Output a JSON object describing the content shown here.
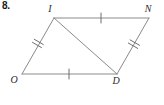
{
  "problem": {
    "number_label": "8."
  },
  "figure": {
    "type": "parallelogram-with-diagonal",
    "stroke_color": "#8a8a8a",
    "label_color": "#2b2b2b",
    "vertices": [
      {
        "name": "I",
        "label": "I",
        "x": 54,
        "y": 18,
        "label_x": 50,
        "label_y": 12
      },
      {
        "name": "N",
        "label": "N",
        "x": 149,
        "y": 18,
        "label_x": 146,
        "label_y": 12
      },
      {
        "name": "O",
        "label": "O",
        "x": 22,
        "y": 74,
        "label_x": 13,
        "label_y": 80
      },
      {
        "name": "D",
        "label": "D",
        "x": 117,
        "y": 74,
        "label_x": 113,
        "label_y": 81
      }
    ],
    "edges": [
      {
        "name": "edge-I-N",
        "from": "I",
        "to": "N",
        "ticks": 1
      },
      {
        "name": "edge-N-D",
        "from": "N",
        "to": "D",
        "ticks": 2
      },
      {
        "name": "edge-O-D",
        "from": "O",
        "to": "D",
        "ticks": 1
      },
      {
        "name": "edge-O-I",
        "from": "O",
        "to": "I",
        "ticks": 2
      }
    ],
    "diagonal": {
      "name": "diagonal-I-D",
      "from": "I",
      "to": "D"
    }
  }
}
